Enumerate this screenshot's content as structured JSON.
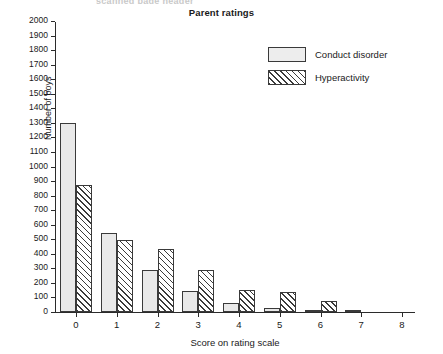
{
  "top_ghost_text": "scanned page header",
  "chart_data": {
    "type": "bar",
    "title": "Parent ratings",
    "xlabel": "Score on rating scale",
    "ylabel": "Number of boys",
    "categories": [
      "0",
      "1",
      "2",
      "3",
      "4",
      "5",
      "6",
      "7",
      "8"
    ],
    "series": [
      {
        "name": "Conduct disorder",
        "fill": "solid",
        "color": "#e9e9e9",
        "values": [
          1300,
          545,
          290,
          145,
          60,
          25,
          15,
          5,
          0
        ]
      },
      {
        "name": "Hyperactivity",
        "fill": "hatch",
        "color": "#ffffff",
        "values": [
          870,
          495,
          435,
          290,
          150,
          135,
          75,
          0,
          0
        ]
      }
    ],
    "ylim": [
      0,
      2000
    ],
    "ytick_step": 100,
    "yticks": [
      0,
      100,
      200,
      300,
      400,
      500,
      600,
      700,
      800,
      900,
      1000,
      1100,
      1200,
      1300,
      1400,
      1500,
      1600,
      1700,
      1800,
      1900,
      2000
    ],
    "grid": false,
    "legend_position": "top-right"
  }
}
